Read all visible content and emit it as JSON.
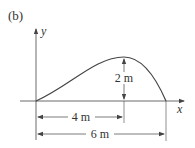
{
  "figure": {
    "panel_label": "(b)",
    "axes": {
      "x_label": "x",
      "y_label": "y"
    },
    "curve": {
      "description": "curve rising from origin to peak and falling to x-axis",
      "peak_height_label": "2 m",
      "peak_position_label": "4 m",
      "total_span_label": "6 m"
    },
    "colors": {
      "line": "#444444",
      "text": "#333333"
    }
  }
}
